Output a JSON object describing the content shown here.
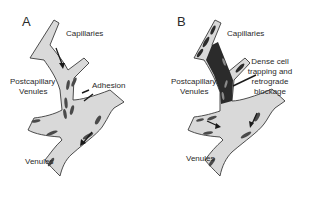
{
  "figure": {
    "panels": [
      {
        "id": "A",
        "letter": "A",
        "labels": {
          "capillaries": "Capillaries",
          "postcapillary_line1": "Postcapillary",
          "postcapillary_line2": "Venules",
          "adhesion": "Adhesion",
          "venules": "Venules"
        }
      },
      {
        "id": "B",
        "letter": "B",
        "labels": {
          "capillaries": "Capillaries",
          "postcapillary_line1": "Postcapillary",
          "postcapillary_line2": "Venules",
          "annotation_line1": "Dense cell",
          "annotation_line2": "trapping and",
          "annotation_line3": "retrograde",
          "annotation_line4": "blockage",
          "venules": "Venules"
        }
      }
    ],
    "colors": {
      "vessel_fill": "#d9d9d9",
      "vessel_outline": "#3a3a3a",
      "cells": "#4a4a4a",
      "background": "#ffffff"
    }
  }
}
